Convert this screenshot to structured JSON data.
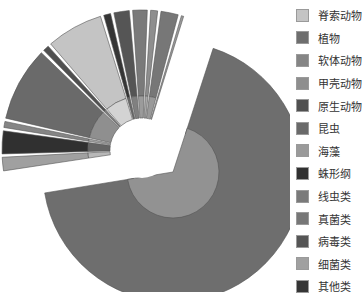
{
  "chart_data": {
    "type": "pie",
    "title": "",
    "legend_position": "right",
    "start_angle_deg": -72,
    "categories": [
      "脊索动物",
      "植物",
      "软体动物",
      "甲壳动物",
      "原生动物",
      "昆虫",
      "海藻",
      "蛛形纲",
      "线虫类",
      "真菌类",
      "病毒类",
      "细菌类",
      "其他类"
    ],
    "colors": [
      "#c4c4c4",
      "#6e6e6e",
      "#858585",
      "#8e8e8e",
      "#505050",
      "#6a6a6a",
      "#9a9a9a",
      "#303030",
      "#7a7a7a",
      "#777777",
      "#555555",
      "#a0a0a0",
      "#353535"
    ],
    "values": [
      6.4,
      62.5,
      1.0,
      1.1,
      1.0,
      8.3,
      0.6,
      2.8,
      1.9,
      2.2,
      2.0,
      1.8,
      1.1
    ],
    "draw_order": [
      1,
      11,
      7,
      2,
      5,
      4,
      0,
      12,
      10,
      8,
      3,
      9,
      6
    ]
  },
  "legend": {
    "items": [
      {
        "label": "脊索动物",
        "color": "#c4c4c4"
      },
      {
        "label": "植物",
        "color": "#6e6e6e"
      },
      {
        "label": "软体动物",
        "color": "#858585"
      },
      {
        "label": "甲壳动物",
        "color": "#8e8e8e"
      },
      {
        "label": "原生动物",
        "color": "#505050"
      },
      {
        "label": "昆虫",
        "color": "#6a6a6a"
      },
      {
        "label": "海藻",
        "color": "#9a9a9a"
      },
      {
        "label": "蛛形纲",
        "color": "#303030"
      },
      {
        "label": "线虫类",
        "color": "#7a7a7a"
      },
      {
        "label": "真菌类",
        "color": "#777777"
      },
      {
        "label": "病毒类",
        "color": "#555555"
      },
      {
        "label": "细菌类",
        "color": "#a0a0a0"
      },
      {
        "label": "其他类",
        "color": "#353535"
      }
    ]
  }
}
